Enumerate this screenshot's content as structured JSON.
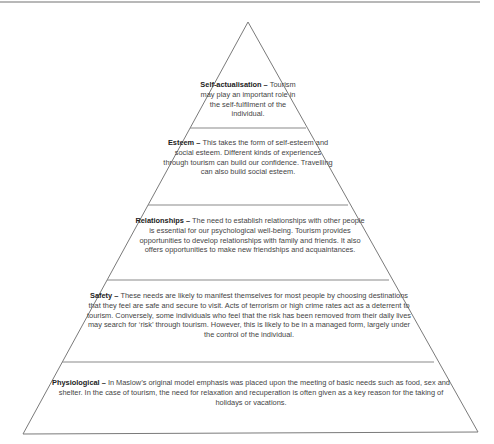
{
  "diagram": {
    "type": "pyramid",
    "tiers": [
      {
        "level": 5,
        "name": "Self-actualisation",
        "separator": " – ",
        "text": "Tourism may play an important role in the self-fulfilment of the individual."
      },
      {
        "level": 4,
        "name": "Esteem",
        "separator": " – ",
        "text": "This takes the form of self-esteem and social esteem. Different kinds of experiences through tourism can build our confidence. Travelling can also build social esteem."
      },
      {
        "level": 3,
        "name": "Relationships",
        "separator": " – ",
        "text": "The need to establish relationships with other people is essential for our psychological well-being. Tourism provides opportunities to develop relationships with family and friends. It also offers opportunities to make new friendships and acquaintances."
      },
      {
        "level": 2,
        "name": "Safety",
        "separator": " – ",
        "text": "These needs are likely to manifest themselves for most people by choosing destinations that they feel are safe and secure to visit. Acts of terrorism or high crime rates act as a deterrent to tourism. Conversely, some individuals who feel that the risk has been removed from their daily lives may search for ‘risk’ through tourism. However, this is likely to be in a managed form, largely under the control of the individual."
      },
      {
        "level": 1,
        "name": "Physiological",
        "separator": " – ",
        "text": "In Maslow’s original model emphasis was placed upon the meeting of basic needs such as food, sex and shelter. In the case of tourism, the need for relaxation and recuperation is often given as a key reason for the taking of holidays or vacations."
      }
    ],
    "colors": {
      "outline": "#7a7a7a",
      "divider": "#8a8a8a",
      "text": "#444444",
      "label": "#222222"
    }
  }
}
